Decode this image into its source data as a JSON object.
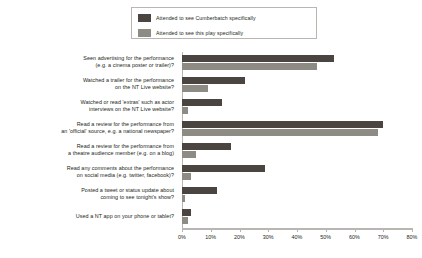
{
  "legend": {
    "position": "top-center",
    "entries": [
      {
        "label": "Attended to see Cumberbatch specifically",
        "color": "#4a4540"
      },
      {
        "label": "Attended to see this play specifically",
        "color": "#8e8b85"
      }
    ]
  },
  "axis": {
    "ticks": [
      "0%",
      "10%",
      "20%",
      "30%",
      "40%",
      "50%",
      "60%",
      "70%",
      "80%"
    ]
  },
  "chart_data": {
    "type": "bar",
    "orientation": "horizontal",
    "title": "",
    "subtitle": "",
    "xlabel": "",
    "ylabel": "",
    "xlim": [
      0,
      80
    ],
    "grid": false,
    "legend_position": "top-center",
    "tick_labels": [
      "0%",
      "10%",
      "20%",
      "30%",
      "40%",
      "50%",
      "60%",
      "70%",
      "80%"
    ],
    "categories": [
      "Seen advertising for the performance (e.g. a cinema poster or trailer)?",
      "Watched a trailer for the performance on the NT Live website?",
      "Watched or read 'extras' such as actor interviews on the NT Live website?",
      "Read a review for the performance from an 'official' source, e.g. a national newspaper?",
      "Read a review for the performance from a theatre audience member (e.g. on a blog)",
      "Read any comments about the performance on social media (e.g. twitter, facebook)?",
      "Posted a tweet or status update about coming to see tonight's show?",
      "Used a NT app on your phone or tablet?"
    ],
    "category_lines": [
      [
        "Seen advertising for the performance",
        "(e.g. a cinema poster or trailer)?"
      ],
      [
        "Watched a trailer for the performance",
        "on the NT Live website?"
      ],
      [
        "Watched or read 'extras' such as actor",
        "interviews on the NT Live website?"
      ],
      [
        "Read a review for the performance from",
        "an 'official' source, e.g. a national newspaper?"
      ],
      [
        "Read a review for the performance from",
        "a theatre audience member (e.g. on a blog)"
      ],
      [
        "Read any comments about the performance",
        "on social media (e.g. twitter, facebook)?"
      ],
      [
        "Posted a tweet or status update about",
        "coming to see tonight's show?"
      ],
      [
        "Used a NT app on your phone or tablet?"
      ]
    ],
    "series": [
      {
        "name": "Attended to see Cumberbatch specifically",
        "color": "#4a4540",
        "values": [
          53,
          22,
          14,
          70,
          17,
          29,
          12,
          3
        ]
      },
      {
        "name": "Attended to see this play specifically",
        "color": "#8e8b85",
        "values": [
          47,
          9,
          2,
          68,
          5,
          3,
          1,
          2
        ]
      }
    ]
  }
}
